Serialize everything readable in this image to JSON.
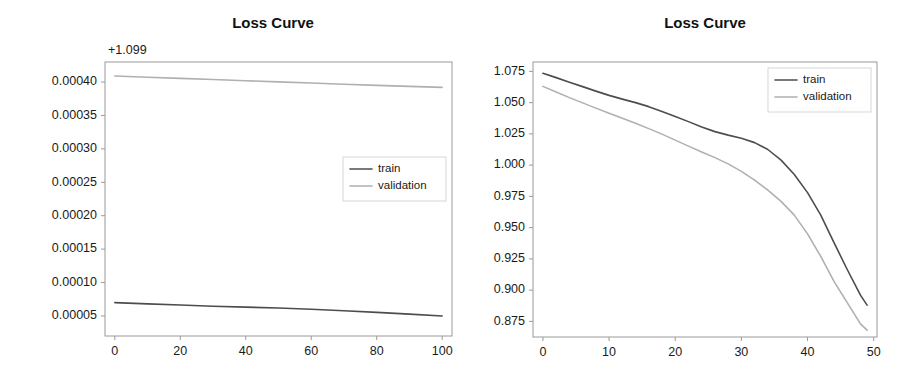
{
  "figure": {
    "width": 919,
    "height": 381,
    "background": "#ffffff",
    "panel_count": 2
  },
  "colors": {
    "train": "#4d4d4d",
    "validation": "#b0b0b0",
    "axis": "#9a9a9a",
    "text": "#1a1a1a"
  },
  "chart_data": [
    {
      "id": "left",
      "type": "line",
      "title": "Loss Curve",
      "xlabel": "",
      "ylabel": "",
      "y_offset_label": "+1.099",
      "y_offset": 1.099,
      "grid": false,
      "legend_position": "center right",
      "xlim": [
        -3,
        103
      ],
      "ylim": [
        2e-05,
        0.00043
      ],
      "xticks": [
        0,
        20,
        40,
        60,
        80,
        100
      ],
      "xtick_labels": [
        "0",
        "20",
        "40",
        "60",
        "80",
        "100"
      ],
      "yticks": [
        5e-05,
        0.0001,
        0.00015,
        0.0002,
        0.00025,
        0.0003,
        0.00035,
        0.0004
      ],
      "ytick_labels": [
        "0.00005",
        "0.00010",
        "0.00015",
        "0.00020",
        "0.00025",
        "0.00030",
        "0.00035",
        "0.00040"
      ],
      "x": [
        0,
        10,
        20,
        30,
        40,
        50,
        60,
        70,
        80,
        90,
        100
      ],
      "series": [
        {
          "name": "train",
          "color": "#4d4d4d",
          "values": [
            7e-05,
            6.81e-05,
            6.63e-05,
            6.46e-05,
            6.32e-05,
            6.18e-05,
            6e-05,
            5.78e-05,
            5.54e-05,
            5.28e-05,
            5e-05
          ]
        },
        {
          "name": "validation",
          "color": "#b0b0b0",
          "values": [
            0.000409,
            0.0004072,
            0.0004055,
            0.0004038,
            0.000402,
            0.0004002,
            0.0003985,
            0.0003968,
            0.000395,
            0.0003935,
            0.000392
          ]
        }
      ]
    },
    {
      "id": "right",
      "type": "line",
      "title": "Loss Curve",
      "xlabel": "",
      "ylabel": "",
      "grid": false,
      "legend_position": "upper right",
      "xlim": [
        -1.5,
        50.5
      ],
      "ylim": [
        0.8625,
        1.0825
      ],
      "xticks": [
        0,
        10,
        20,
        30,
        40,
        50
      ],
      "xtick_labels": [
        "0",
        "10",
        "20",
        "30",
        "40",
        "50"
      ],
      "yticks": [
        0.875,
        0.9,
        0.925,
        0.95,
        0.975,
        1.0,
        1.025,
        1.05,
        1.075
      ],
      "ytick_labels": [
        "0.875",
        "0.900",
        "0.925",
        "0.950",
        "0.975",
        "1.000",
        "1.025",
        "1.050",
        "1.075"
      ],
      "x": [
        0,
        2,
        4,
        6,
        8,
        10,
        12,
        14,
        16,
        18,
        20,
        22,
        24,
        26,
        28,
        30,
        32,
        34,
        36,
        38,
        40,
        42,
        44,
        46,
        48,
        49
      ],
      "series": [
        {
          "name": "train",
          "color": "#4d4d4d",
          "values": [
            1.0735,
            1.07,
            1.0663,
            1.0628,
            1.0592,
            1.0558,
            1.0528,
            1.05,
            1.0468,
            1.043,
            1.039,
            1.0348,
            1.0305,
            1.0268,
            1.024,
            1.0215,
            1.018,
            1.0125,
            1.004,
            0.9925,
            0.978,
            0.96,
            0.938,
            0.9165,
            0.896,
            0.888
          ]
        },
        {
          "name": "validation",
          "color": "#b0b0b0",
          "values": [
            1.063,
            1.0585,
            1.054,
            1.0498,
            1.0456,
            1.0415,
            1.0375,
            1.0335,
            1.0292,
            1.0248,
            1.02,
            1.0152,
            1.0105,
            1.006,
            1.001,
            0.995,
            0.988,
            0.98,
            0.971,
            0.96,
            0.945,
            0.927,
            0.907,
            0.89,
            0.873,
            0.868
          ]
        }
      ]
    }
  ],
  "legend": {
    "entries": [
      {
        "label": "train",
        "color": "#4d4d4d"
      },
      {
        "label": "validation",
        "color": "#b0b0b0"
      }
    ]
  }
}
